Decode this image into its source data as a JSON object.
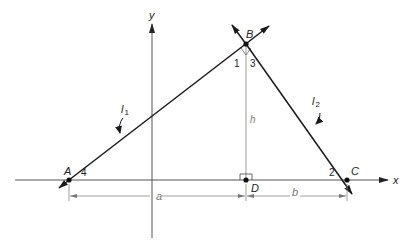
{
  "diagram": {
    "axes": {
      "x_label": "x",
      "y_label": "y"
    },
    "points": {
      "A": "A",
      "B": "B",
      "C": "C",
      "D": "D"
    },
    "lines": {
      "l1_main": "l",
      "l1_sub": "1",
      "l2_main": "l",
      "l2_sub": "2"
    },
    "angles": {
      "angle1": "1",
      "angle2": "2",
      "angle3": "3",
      "angle4": "4"
    },
    "segments": {
      "height": "h",
      "a": "a",
      "b": "b"
    },
    "colors": {
      "line": "#1a1a1a",
      "axis": "#555555",
      "dimension": "#888888"
    }
  }
}
